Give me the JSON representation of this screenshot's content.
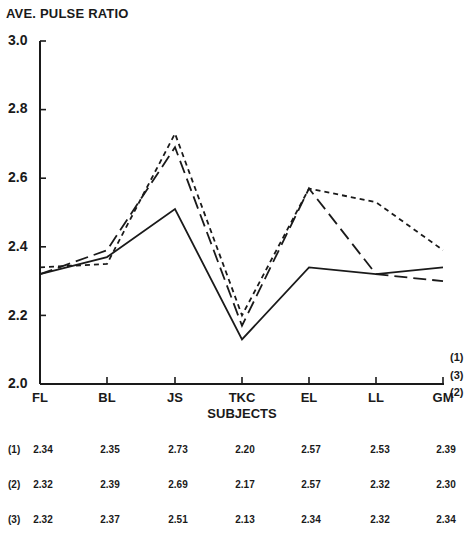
{
  "chart_data": {
    "type": "line",
    "title": "",
    "ylabel": "AVE. PULSE RATIO",
    "xlabel": "SUBJECTS",
    "ylim": [
      2.0,
      3.0
    ],
    "yticks": [
      "2.0",
      "2.2",
      "2.4",
      "2.6",
      "2.8",
      "3.0"
    ],
    "categories": [
      "FL",
      "BL",
      "JS",
      "TKC",
      "EL",
      "LL",
      "GM"
    ],
    "grid": false,
    "legend_position": "right, inline at line ends",
    "series": [
      {
        "name": "(1)",
        "style": "short-dashed",
        "values": [
          2.34,
          2.35,
          2.73,
          2.2,
          2.57,
          2.53,
          2.39
        ]
      },
      {
        "name": "(2)",
        "style": "long-dashed",
        "values": [
          2.32,
          2.39,
          2.69,
          2.17,
          2.57,
          2.32,
          2.3
        ]
      },
      {
        "name": "(3)",
        "style": "solid",
        "values": [
          2.32,
          2.37,
          2.51,
          2.13,
          2.34,
          2.32,
          2.34
        ]
      }
    ]
  },
  "labels": {
    "ylabel": "AVE. PULSE RATIO",
    "xlabel": "SUBJECTS",
    "yticks": [
      "2.0",
      "2.2",
      "2.4",
      "2.6",
      "2.8",
      "3.0"
    ],
    "xticks": [
      "FL",
      "BL",
      "JS",
      "TKC",
      "EL",
      "LL",
      "GM"
    ],
    "legend": [
      "(1)",
      "(3)",
      "(2)"
    ]
  },
  "table": {
    "rows": [
      {
        "label": "(1)",
        "values": [
          "2.34",
          "2.35",
          "2.73",
          "2.20",
          "2.57",
          "2.53",
          "2.39"
        ]
      },
      {
        "label": "(2)",
        "values": [
          "2.32",
          "2.39",
          "2.69",
          "2.17",
          "2.57",
          "2.32",
          "2.30"
        ]
      },
      {
        "label": "(3)",
        "values": [
          "2.32",
          "2.37",
          "2.51",
          "2.13",
          "2.34",
          "2.32",
          "2.34"
        ]
      }
    ]
  }
}
